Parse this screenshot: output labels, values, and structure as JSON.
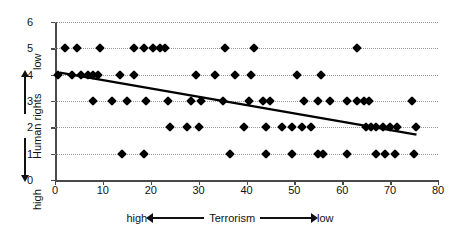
{
  "chart_data": {
    "type": "scatter",
    "title": "",
    "xlabel": "Terrorism",
    "ylabel": "Human rights",
    "xlabel_left_anchor": "high",
    "xlabel_right_anchor": "low",
    "ylabel_top_anchor": "low",
    "ylabel_bottom_anchor": "high",
    "xlim": [
      0,
      80
    ],
    "ylim": [
      0,
      6
    ],
    "xticks": [
      0,
      10,
      20,
      30,
      40,
      50,
      60,
      70,
      80
    ],
    "yticks": [
      0,
      1,
      2,
      3,
      4,
      5,
      6
    ],
    "grid": "horizontal-dotted",
    "legend": "none",
    "marker": "diamond",
    "marker_color": "#000000",
    "points": [
      {
        "x": 2.0,
        "y": 5
      },
      {
        "x": 4.5,
        "y": 5
      },
      {
        "x": 9.5,
        "y": 5
      },
      {
        "x": 16.5,
        "y": 5
      },
      {
        "x": 18.5,
        "y": 5
      },
      {
        "x": 20.5,
        "y": 5
      },
      {
        "x": 22.0,
        "y": 5
      },
      {
        "x": 23.0,
        "y": 5
      },
      {
        "x": 35.5,
        "y": 5
      },
      {
        "x": 41.5,
        "y": 5
      },
      {
        "x": 63.0,
        "y": 5
      },
      {
        "x": 0.6,
        "y": 4
      },
      {
        "x": 3.5,
        "y": 4
      },
      {
        "x": 5.5,
        "y": 4
      },
      {
        "x": 6.8,
        "y": 4
      },
      {
        "x": 8.0,
        "y": 4
      },
      {
        "x": 9.0,
        "y": 4
      },
      {
        "x": 13.5,
        "y": 4
      },
      {
        "x": 16.5,
        "y": 4
      },
      {
        "x": 29.5,
        "y": 4
      },
      {
        "x": 33.5,
        "y": 4
      },
      {
        "x": 37.5,
        "y": 4
      },
      {
        "x": 41.0,
        "y": 4
      },
      {
        "x": 50.5,
        "y": 4
      },
      {
        "x": 55.5,
        "y": 4
      },
      {
        "x": 8.0,
        "y": 3
      },
      {
        "x": 12.0,
        "y": 3
      },
      {
        "x": 15.0,
        "y": 3
      },
      {
        "x": 19.0,
        "y": 3
      },
      {
        "x": 23.5,
        "y": 3
      },
      {
        "x": 28.5,
        "y": 3
      },
      {
        "x": 30.5,
        "y": 3
      },
      {
        "x": 35.0,
        "y": 3
      },
      {
        "x": 40.5,
        "y": 3
      },
      {
        "x": 43.5,
        "y": 3
      },
      {
        "x": 45.0,
        "y": 3
      },
      {
        "x": 52.0,
        "y": 3
      },
      {
        "x": 55.0,
        "y": 3
      },
      {
        "x": 57.5,
        "y": 3
      },
      {
        "x": 61.0,
        "y": 3
      },
      {
        "x": 63.0,
        "y": 3
      },
      {
        "x": 64.5,
        "y": 3
      },
      {
        "x": 65.5,
        "y": 3
      },
      {
        "x": 74.5,
        "y": 3
      },
      {
        "x": 24.0,
        "y": 2
      },
      {
        "x": 27.5,
        "y": 2
      },
      {
        "x": 30.0,
        "y": 2
      },
      {
        "x": 39.5,
        "y": 2
      },
      {
        "x": 44.0,
        "y": 2
      },
      {
        "x": 47.5,
        "y": 2
      },
      {
        "x": 49.5,
        "y": 2
      },
      {
        "x": 51.5,
        "y": 2
      },
      {
        "x": 53.5,
        "y": 2
      },
      {
        "x": 65.0,
        "y": 2
      },
      {
        "x": 66.0,
        "y": 2
      },
      {
        "x": 67.0,
        "y": 2
      },
      {
        "x": 68.5,
        "y": 2
      },
      {
        "x": 70.0,
        "y": 2
      },
      {
        "x": 71.5,
        "y": 2
      },
      {
        "x": 75.5,
        "y": 2
      },
      {
        "x": 14.0,
        "y": 1
      },
      {
        "x": 18.5,
        "y": 1
      },
      {
        "x": 36.5,
        "y": 1
      },
      {
        "x": 44.0,
        "y": 1
      },
      {
        "x": 49.5,
        "y": 1
      },
      {
        "x": 55.0,
        "y": 1
      },
      {
        "x": 56.0,
        "y": 1
      },
      {
        "x": 61.0,
        "y": 1
      },
      {
        "x": 67.0,
        "y": 1
      },
      {
        "x": 69.0,
        "y": 1
      },
      {
        "x": 71.0,
        "y": 1
      },
      {
        "x": 75.0,
        "y": 1
      }
    ],
    "trendline": {
      "type": "linear",
      "color": "#000000",
      "x_start": 1.0,
      "y_start": 4.08,
      "x_end": 75.5,
      "y_end": 1.72
    }
  }
}
